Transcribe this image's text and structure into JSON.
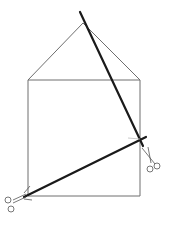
{
  "diagram": {
    "title": "",
    "colors": {
      "background": "#ffffff",
      "thin_line": "#6e6e6e",
      "thick_line": "#1a1a1a",
      "scissors": "#555555"
    },
    "shape": {
      "apex": [
        83,
        23
      ],
      "square_top_left": [
        28,
        80
      ],
      "square_top_right": [
        140,
        80
      ],
      "square_bottom_right": [
        140,
        196
      ],
      "square_bottom_left": [
        28,
        196
      ]
    },
    "cuts": [
      {
        "from": [
          80,
          12
        ],
        "to": [
          143,
          146
        ]
      },
      {
        "from": [
          24,
          197
        ],
        "to": [
          146,
          137
        ]
      }
    ],
    "scissors": [
      {
        "name": "scissors-right",
        "position": [
          143,
          150
        ]
      },
      {
        "name": "scissors-left",
        "position": [
          4,
          191
        ]
      }
    ]
  }
}
